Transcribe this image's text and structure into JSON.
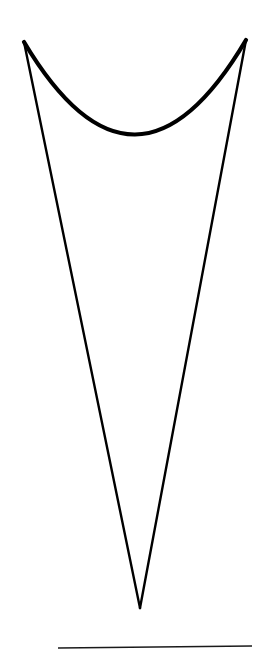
{
  "figure": {
    "kind": "line-drawing",
    "canvas": {
      "width": 253,
      "height": 666
    },
    "background_color": "#ffffff",
    "stroke_color": "#000000",
    "elements": [
      {
        "name": "left-side-line",
        "type": "line",
        "stroke_color": "#000000",
        "stroke_width": 2.4,
        "points": [
          [
            24,
            42
          ],
          [
            140,
            608
          ]
        ]
      },
      {
        "name": "right-side-line",
        "type": "line",
        "stroke_color": "#000000",
        "stroke_width": 2.4,
        "points": [
          [
            246,
            40
          ],
          [
            140,
            608
          ]
        ]
      },
      {
        "name": "top-arc",
        "type": "quadratic-curve",
        "stroke_color": "#000000",
        "stroke_width": 4.2,
        "start": [
          24,
          42
        ],
        "control": [
          135,
          228
        ],
        "end": [
          246,
          40
        ],
        "lowest_point": [
          133,
          149
        ]
      },
      {
        "name": "baseline-rule",
        "type": "line",
        "stroke_color": "#1a1a1a",
        "stroke_width": 1.6,
        "points": [
          [
            58,
            648
          ],
          [
            252,
            646
          ]
        ]
      }
    ],
    "vertex_label": "",
    "apex_left_label": "",
    "apex_right_label": ""
  }
}
